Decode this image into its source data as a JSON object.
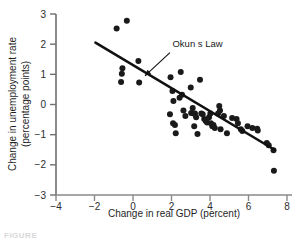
{
  "figure": {
    "caption_fragment": "FIGURE"
  },
  "chart_data": {
    "type": "scatter",
    "title": "",
    "xlabel": "Change in real GDP (percent)",
    "ylabel": "Change in unemployment rate (percentage points)",
    "ylabel_line1": "Change in unemployment rate",
    "ylabel_line2": "(percentage points)",
    "xlim": [
      -4,
      8
    ],
    "ylim": [
      -3,
      3
    ],
    "xticks": [
      -4,
      -2,
      0,
      2,
      4,
      6,
      8
    ],
    "xtick_labels": [
      "−4",
      "−2",
      "0",
      "2",
      "4",
      "6",
      "8"
    ],
    "yticks": [
      -3,
      -2,
      -1,
      0,
      1,
      2,
      3
    ],
    "ytick_labels": [
      "−3",
      "−2",
      "−1",
      "0",
      "1",
      "2",
      "3"
    ],
    "grid": false,
    "legend": null,
    "marker": "filled-circle",
    "marker_color": "#1a1a1a",
    "marker_size": 3.0,
    "points": [
      [
        -0.85,
        2.52
      ],
      [
        -0.32,
        2.78
      ],
      [
        -0.55,
        1.2
      ],
      [
        -0.58,
        1.02
      ],
      [
        0.28,
        1.44
      ],
      [
        -0.62,
        0.75
      ],
      [
        0.32,
        0.73
      ],
      [
        1.95,
        0.9
      ],
      [
        2.05,
        0.45
      ],
      [
        2.1,
        0.12
      ],
      [
        2.48,
        1.08
      ],
      [
        2.42,
        0.22
      ],
      [
        2.55,
        0.32
      ],
      [
        1.92,
        -0.32
      ],
      [
        2.08,
        -0.62
      ],
      [
        2.18,
        -0.68
      ],
      [
        2.22,
        -0.95
      ],
      [
        2.62,
        -0.2
      ],
      [
        2.72,
        -0.38
      ],
      [
        3.0,
        0.56
      ],
      [
        3.1,
        -0.12
      ],
      [
        3.02,
        -0.28
      ],
      [
        3.15,
        -0.3
      ],
      [
        3.22,
        -0.3
      ],
      [
        3.28,
        -0.42
      ],
      [
        3.18,
        -0.72
      ],
      [
        3.35,
        -0.98
      ],
      [
        3.48,
        0.82
      ],
      [
        3.55,
        -0.3
      ],
      [
        3.62,
        -0.32
      ],
      [
        3.7,
        -0.48
      ],
      [
        3.78,
        -0.55
      ],
      [
        3.85,
        -0.6
      ],
      [
        3.95,
        -0.42
      ],
      [
        4.02,
        -0.3
      ],
      [
        4.05,
        -0.62
      ],
      [
        4.12,
        -0.72
      ],
      [
        4.18,
        -0.68
      ],
      [
        4.25,
        -0.78
      ],
      [
        4.42,
        -0.3
      ],
      [
        4.48,
        -0.05
      ],
      [
        4.52,
        -0.2
      ],
      [
        4.55,
        -0.82
      ],
      [
        4.72,
        -0.38
      ],
      [
        4.88,
        -0.95
      ],
      [
        5.15,
        -0.45
      ],
      [
        5.38,
        -0.48
      ],
      [
        5.45,
        -0.62
      ],
      [
        5.6,
        -0.82
      ],
      [
        5.68,
        -0.88
      ],
      [
        5.95,
        -0.72
      ],
      [
        6.2,
        -0.78
      ],
      [
        6.45,
        -0.8
      ],
      [
        6.48,
        -0.86
      ],
      [
        6.95,
        -1.28
      ],
      [
        7.05,
        -1.35
      ],
      [
        7.3,
        -1.52
      ],
      [
        7.32,
        -2.2
      ]
    ],
    "trend_line": {
      "label": "Okun s Law",
      "x0": -1.95,
      "y0": 2.05,
      "x1": 7.35,
      "y1": -1.5,
      "color": "#111111",
      "width": 2.6
    },
    "annotation": {
      "text": "Okun s Law",
      "text_x": 2.05,
      "text_y": 1.92,
      "arrow_tail_x": 1.92,
      "arrow_tail_y": 1.72,
      "arrow_head_x": 0.62,
      "arrow_head_y": 0.95
    }
  }
}
